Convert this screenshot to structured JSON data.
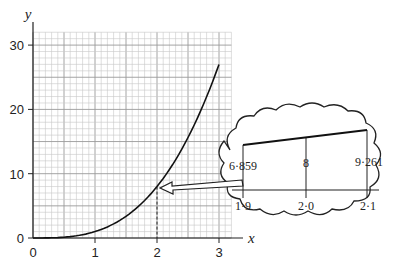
{
  "chart_data": {
    "type": "line",
    "title": "",
    "xlabel": "x",
    "ylabel": "y",
    "xlim": [
      0,
      3.2
    ],
    "ylim": [
      0,
      32
    ],
    "grid": true,
    "x_ticks": [
      "0",
      "1",
      "2",
      "3"
    ],
    "y_ticks": [
      "0",
      "10",
      "20",
      "30"
    ],
    "series": [
      {
        "name": "y = x^3",
        "x": [
          0,
          0.5,
          1,
          1.5,
          2,
          2.5,
          3
        ],
        "y": [
          0,
          0.125,
          1,
          3.375,
          8,
          15.625,
          27
        ]
      }
    ],
    "annotations": {
      "dashed_guide_x": 2,
      "zoom_callout": {
        "x_labels": [
          "1·9",
          "2·0",
          "2·1"
        ],
        "y_labels": [
          "6·859",
          "8",
          "9·261"
        ],
        "points": [
          [
            1.9,
            6.859
          ],
          [
            2.0,
            8
          ],
          [
            2.1,
            9.261
          ]
        ]
      }
    }
  },
  "axis": {
    "x_label": "x",
    "y_label": "y",
    "x_ticks": [
      "0",
      "1",
      "2",
      "3"
    ],
    "y_ticks": [
      "0",
      "10",
      "20",
      "30"
    ]
  },
  "callout": {
    "x_labels": [
      "1·9",
      "2·0",
      "2·1"
    ],
    "y_labels": [
      "6·859",
      "8",
      "9·261"
    ]
  }
}
